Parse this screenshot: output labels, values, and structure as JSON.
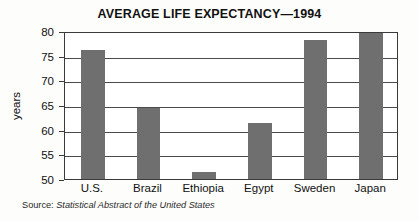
{
  "chart_data": {
    "type": "bar",
    "title": "AVERAGE LIFE EXPECTANCY—1994",
    "categories": [
      "U.S.",
      "Brazil",
      "Ethiopia",
      "Egypt",
      "Sweden",
      "Japan"
    ],
    "values": [
      76.1,
      64.4,
      51.5,
      61.3,
      78.2,
      79.6
    ],
    "xlabel": "",
    "ylabel": "years",
    "ylim": [
      50,
      80
    ],
    "yticks": [
      50,
      55,
      60,
      65,
      70,
      75,
      80
    ],
    "ytick_labels": [
      "50",
      "55",
      "60",
      "65",
      "70",
      "75",
      "80"
    ],
    "grid": true,
    "legend": false,
    "bar_color": "#6f6f6f",
    "axis_color": "#3a3a3a",
    "plot_background": "#ffffff"
  },
  "source": {
    "prefix": "Source:",
    "publication": "Statistical Abstract of the United States"
  }
}
